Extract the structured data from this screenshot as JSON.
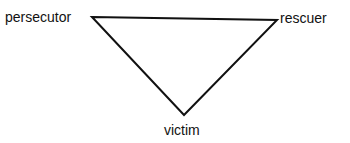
{
  "diagram": {
    "type": "triangle",
    "title": "",
    "nodes": [
      {
        "id": "persecutor",
        "label": "persecutor",
        "position": "top-left"
      },
      {
        "id": "rescuer",
        "label": "rescuer",
        "position": "top-right"
      },
      {
        "id": "victim",
        "label": "victim",
        "position": "bottom"
      }
    ],
    "edges": [
      {
        "from": "persecutor",
        "to": "rescuer"
      },
      {
        "from": "rescuer",
        "to": "victim"
      },
      {
        "from": "victim",
        "to": "persecutor"
      }
    ],
    "colors": {
      "line": "#111111",
      "text": "#111111",
      "background": "#ffffff"
    }
  }
}
